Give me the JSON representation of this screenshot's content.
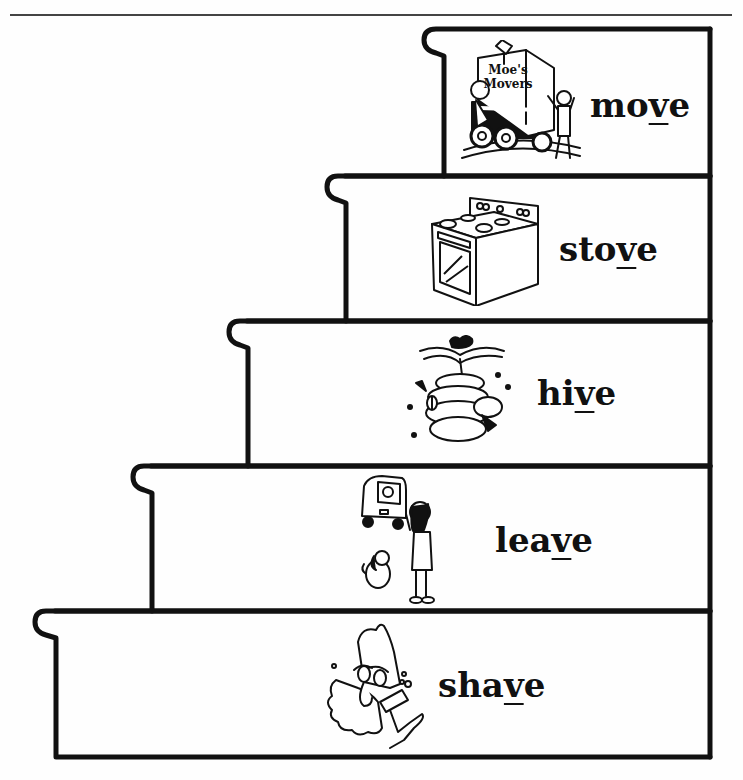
{
  "worksheet": {
    "theme": "long vowel words ending in silent e / final v-e pattern",
    "stairs": [
      {
        "index": 0,
        "word_prefix": "mo",
        "word_highlight": "v",
        "word_suffix": "e",
        "word": "move",
        "picture": "moving truck with mover carrying lamp and woman",
        "picture_text": [
          "Moe's",
          "Movers"
        ]
      },
      {
        "index": 1,
        "word_prefix": "sto",
        "word_highlight": "v",
        "word_suffix": "e",
        "word": "stove",
        "picture": "kitchen stove with oven"
      },
      {
        "index": 2,
        "word_prefix": "hi",
        "word_highlight": "v",
        "word_suffix": "e",
        "word": "hive",
        "picture": "beehive hanging from branch with bee"
      },
      {
        "index": 3,
        "word_prefix": "lea",
        "word_highlight": "v",
        "word_suffix": "e",
        "word": "leave",
        "picture": "girl and dog waving at departing car"
      },
      {
        "index": 4,
        "word_prefix": "sha",
        "word_highlight": "v",
        "word_suffix": "e",
        "word": "shave",
        "picture": "man shaving with razor and lather"
      }
    ]
  },
  "colors": {
    "ink": "#111111",
    "paper": "#fefefe",
    "rule": "#444444"
  }
}
